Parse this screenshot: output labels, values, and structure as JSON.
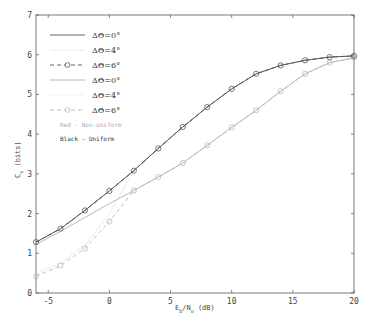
{
  "chart_data": {
    "type": "line",
    "title": "",
    "xlabel": "E_b/N_o (dB)",
    "xlabel_main": "E",
    "xlabel_sub1": "b",
    "xlabel_mid": "/N",
    "xlabel_sub2": "o",
    "xlabel_tail": " (dB)",
    "ylabel": "C_s (bits)",
    "ylabel_main": "C",
    "ylabel_sub": "s",
    "ylabel_tail": " (bits)",
    "xlim": [
      -6,
      20
    ],
    "ylim": [
      0,
      7
    ],
    "xticks": [
      -5,
      0,
      5,
      10,
      15,
      20
    ],
    "yticks": [
      0,
      1,
      2,
      3,
      4,
      5,
      6,
      7
    ],
    "grid": false,
    "legend_position": "upper left",
    "x": [
      -6,
      -4,
      -2,
      0,
      2,
      4,
      6,
      8,
      10,
      12,
      14,
      16,
      18,
      20
    ],
    "series": [
      {
        "name": "ΔΘ=0°",
        "group": "Black - Uniform",
        "color": "#555555",
        "style": "solid",
        "marker": "none",
        "values": [
          1.28,
          1.62,
          2.08,
          2.57,
          3.08,
          3.64,
          4.18,
          4.68,
          5.14,
          5.52,
          5.73,
          5.86,
          5.94,
          5.97
        ]
      },
      {
        "name": "ΔΘ=4°",
        "group": "Black - Uniform",
        "color": "#666666",
        "style": "dotted",
        "marker": "none",
        "values": [
          1.28,
          1.62,
          2.08,
          2.57,
          3.08,
          3.64,
          4.18,
          4.68,
          5.14,
          5.52,
          5.73,
          5.86,
          5.94,
          5.97
        ]
      },
      {
        "name": "ΔΘ=6°",
        "group": "Black - Uniform",
        "color": "#555555",
        "style": "dashed",
        "marker": "circle",
        "values": [
          1.28,
          1.62,
          2.08,
          2.57,
          3.08,
          3.64,
          4.18,
          4.68,
          5.14,
          5.52,
          5.73,
          5.86,
          5.94,
          5.97
        ]
      },
      {
        "name": "ΔΘ=0°",
        "group": "Red - Non-uniform",
        "color": "#b0b0b0",
        "style": "solid",
        "marker": "none",
        "values": [
          1.22,
          1.55,
          1.9,
          2.25,
          2.58,
          2.92,
          3.27,
          3.72,
          4.17,
          4.6,
          5.08,
          5.52,
          5.8,
          5.92
        ]
      },
      {
        "name": "ΔΘ=4°",
        "group": "Red - Non-uniform",
        "color": "#c4c4c4",
        "style": "dotted",
        "marker": "none",
        "values": [
          0.5,
          0.75,
          1.2,
          2.0,
          3.08,
          3.64,
          4.18,
          4.68,
          5.14,
          5.52,
          5.73,
          5.86,
          5.94,
          5.97
        ]
      },
      {
        "name": "ΔΘ=6°",
        "group": "Red - Non-uniform",
        "color": "#b8b8b8",
        "style": "dashed",
        "marker": "circle",
        "values": [
          0.42,
          0.69,
          1.12,
          1.8,
          2.58,
          2.92,
          3.27,
          3.72,
          4.17,
          4.6,
          5.08,
          5.52,
          5.8,
          5.92
        ]
      }
    ],
    "legend": [
      {
        "label": "ΔΘ=0°",
        "color": "#555555",
        "style": "solid",
        "marker": "none"
      },
      {
        "label": "ΔΘ=4°",
        "color": "#c8c8c8",
        "style": "dotted",
        "marker": "none"
      },
      {
        "label": "ΔΘ=6°",
        "color": "#555555",
        "style": "dashed",
        "marker": "circle"
      },
      {
        "label": "ΔΘ=0°",
        "color": "#b0b0b0",
        "style": "solid",
        "marker": "none"
      },
      {
        "label": "ΔΘ=4°",
        "color": "#dddddd",
        "style": "dotted",
        "marker": "none"
      },
      {
        "label": "ΔΘ=6°",
        "color": "#b8b8b8",
        "style": "dashed",
        "marker": "circle"
      }
    ],
    "annotations": [
      {
        "text": "Red - Non-uniform",
        "color": "#aaaaaa"
      },
      {
        "text": "Black - Uniform",
        "color": "#333333"
      }
    ]
  }
}
